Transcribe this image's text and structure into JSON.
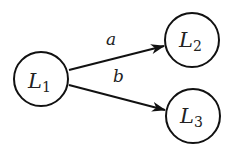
{
  "diagram": {
    "type": "directed-graph",
    "nodes": [
      {
        "id": "L1",
        "main": "L",
        "sub": "1",
        "cx": 41,
        "cy": 79,
        "r": 27
      },
      {
        "id": "L2",
        "main": "L",
        "sub": "2",
        "cx": 192,
        "cy": 40,
        "r": 27
      },
      {
        "id": "L3",
        "main": "L",
        "sub": "3",
        "cx": 193,
        "cy": 116,
        "r": 27
      }
    ],
    "edges": [
      {
        "from": "L1",
        "to": "L2",
        "label": "a"
      },
      {
        "from": "L1",
        "to": "L3",
        "label": "b"
      }
    ],
    "colors": {
      "stroke": "#111111",
      "text": "#222222",
      "background": "#ffffff"
    }
  }
}
